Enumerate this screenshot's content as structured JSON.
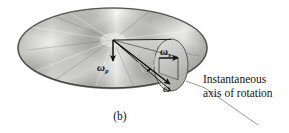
{
  "figure": {
    "caption": "(b)",
    "annotation": {
      "line1": "Instantaneous",
      "line2": "axis of rotation"
    },
    "labels": {
      "precession": {
        "symbol": "ω",
        "subscript": "p"
      },
      "spin": {
        "symbol": "ω",
        "subscript": "s"
      },
      "total": {
        "symbol": "ω",
        "subscript": ""
      }
    },
    "colors": {
      "disk_light": "#f2f2f0",
      "disk_mid": "#a8a8a6",
      "disk_dark": "#6e6e6c",
      "disk_edge": "#2e2e2e",
      "cone_fill": "#b9b9b7",
      "cone_light": "#e2e2e0",
      "vector_stroke": "#111111",
      "leader_line": "#8c8c8c",
      "text": "#141414",
      "background": "#ffffff"
    }
  }
}
